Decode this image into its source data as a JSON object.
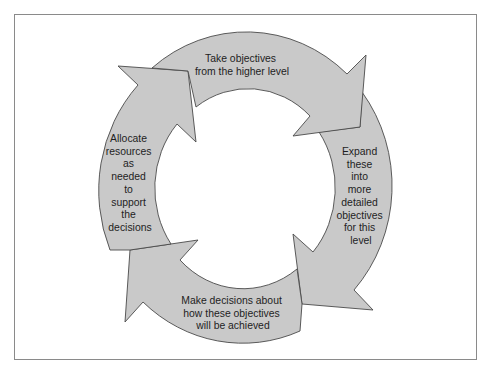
{
  "diagram": {
    "type": "cycle",
    "direction": "clockwise",
    "fill_color": "#c9c9c9",
    "stroke_color": "#4a4a4a",
    "steps": [
      {
        "id": "top",
        "lines": [
          "Take objectives",
          "from the higher level"
        ]
      },
      {
        "id": "right",
        "lines": [
          "Expand",
          "these",
          "into",
          "more",
          "detailed",
          "objectives",
          "for this",
          "level"
        ]
      },
      {
        "id": "bottom",
        "lines": [
          "Make decisions about",
          "how these objectives",
          "will be achieved"
        ]
      },
      {
        "id": "left",
        "lines": [
          "Allocate",
          "resources",
          "as",
          "needed",
          "to",
          "support",
          "the",
          "decisions"
        ]
      }
    ]
  }
}
